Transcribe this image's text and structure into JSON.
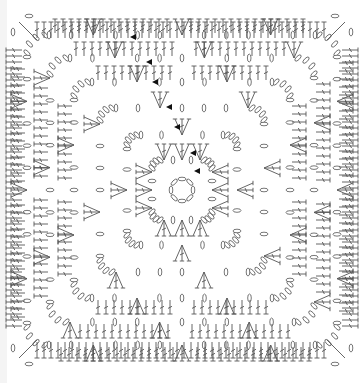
{
  "diagram": {
    "type": "crochet-chart",
    "canvas": {
      "width": 363,
      "height": 383,
      "background": "#ffffff"
    },
    "line_color": "#555555",
    "marker_color": "#111111",
    "center": [
      182,
      190
    ],
    "center_ring": {
      "radius": 11,
      "chains": 8
    },
    "rounds": [
      {
        "n": 1,
        "half": 30,
        "corner_radius": 8
      },
      {
        "n": 2,
        "half": 55,
        "corner_radius": 10
      },
      {
        "n": 3,
        "half": 82,
        "corner_radius": 12
      },
      {
        "n": 4,
        "half": 108,
        "corner_radius": 14
      },
      {
        "n": 5,
        "half": 132,
        "corner_radius": 16
      },
      {
        "n": 6,
        "half": 155,
        "corner_radius": 18
      }
    ],
    "stitch_symbols": [
      "chain",
      "double-crochet",
      "treble-crochet",
      "shell-cluster",
      "slip-stitch"
    ],
    "start_markers": [
      {
        "x": 130,
        "y": 37
      },
      {
        "x": 146,
        "y": 62
      },
      {
        "x": 152,
        "y": 82
      },
      {
        "x": 166,
        "y": 107
      },
      {
        "x": 174,
        "y": 127
      },
      {
        "x": 190,
        "y": 153
      },
      {
        "x": 194,
        "y": 171
      }
    ],
    "legend": []
  }
}
